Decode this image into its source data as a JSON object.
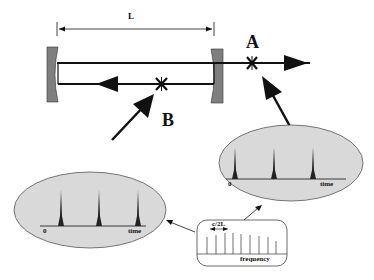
{
  "cavity": {
    "length_label": "L",
    "point_a_label": "A",
    "point_b_label": "B"
  },
  "inset_output": {
    "axis_origin": "0",
    "axis_label": "time",
    "pulse_count": 3
  },
  "inset_intracavity": {
    "axis_origin": "0",
    "axis_label": "time",
    "pulse_count": 3
  },
  "spectrum_inset": {
    "spacing_label": "c/2L",
    "axis_label": "frequency",
    "line_count": 9
  },
  "colors": {
    "mirror": "#7f7f7f",
    "ellipse_fill": "#d9d9d9",
    "line": "#111111"
  }
}
